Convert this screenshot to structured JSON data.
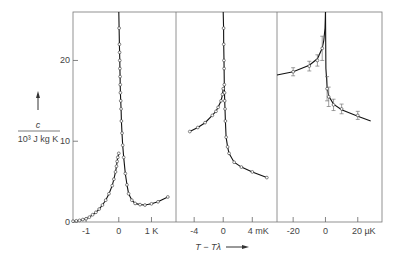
{
  "chart_data": {
    "type": "line",
    "title": "",
    "ylabel_numerator": "c",
    "ylabel_denominator": "10³ J kg K",
    "xlabel": "T − Tλ",
    "ylim": [
      0,
      26
    ],
    "yticks": [
      0,
      10,
      20
    ],
    "ytick_labels": [
      "0",
      "10",
      "20"
    ],
    "grid": false,
    "legend": null,
    "panels": [
      {
        "name": "K-scale",
        "xlim": [
          -1.4,
          1.75
        ],
        "xticks": [
          -1,
          0,
          1
        ],
        "xtick_labels": [
          "-1",
          "0",
          "1 K"
        ],
        "unit": "K",
        "markers": "circles",
        "series": [
          {
            "name": "below-lambda",
            "x": [
              -1.4,
              -1.3,
              -1.2,
              -1.1,
              -1.0,
              -0.9,
              -0.8,
              -0.7,
              -0.6,
              -0.5,
              -0.4,
              -0.3,
              -0.2,
              -0.15,
              -0.1,
              -0.07,
              -0.05,
              -0.03,
              0
            ],
            "y": [
              0.1,
              0.15,
              0.2,
              0.3,
              0.4,
              0.6,
              0.9,
              1.2,
              1.6,
              2.1,
              2.7,
              3.5,
              4.5,
              5.3,
              6.2,
              6.9,
              7.5,
              8.0,
              8.5
            ]
          },
          {
            "name": "above-lambda",
            "x": [
              0.0,
              0.01,
              0.02,
              0.025,
              0.03,
              0.035,
              0.04,
              0.045,
              0.05,
              0.06,
              0.07,
              0.08,
              0.1,
              0.12,
              0.15,
              0.2,
              0.25,
              0.3,
              0.4,
              0.5,
              0.65,
              0.8,
              1.0,
              1.2,
              1.5
            ],
            "y": [
              26,
              24,
              22,
              21,
              20,
              19,
              18,
              17,
              16,
              15,
              14,
              12.5,
              11,
              9.5,
              8,
              6,
              4.6,
              3.5,
              2.7,
              2.3,
              2.15,
              2.1,
              2.25,
              2.5,
              3.1
            ]
          }
        ]
      },
      {
        "name": "mK-scale",
        "xlim": [
          -6.5,
          7.4
        ],
        "xticks": [
          -4,
          0,
          4
        ],
        "xtick_labels": [
          "-4",
          "0",
          "4 mK"
        ],
        "unit": "mK",
        "markers": "circles",
        "series": [
          {
            "name": "below-lambda",
            "x": [
              -4.6,
              -3.5,
              -2.5,
              -1.5,
              -1.0,
              -0.7,
              -0.3,
              -0.1,
              0
            ],
            "y": [
              11.2,
              11.7,
              12.3,
              13.2,
              13.7,
              14.2,
              15.0,
              15.8,
              16.5
            ]
          },
          {
            "name": "above-lambda",
            "x": [
              0.0,
              0.05,
              0.07,
              0.1,
              0.12,
              0.15,
              0.18,
              0.2,
              0.25,
              0.3,
              0.4,
              0.6,
              0.8,
              1.5,
              2.5,
              4.0,
              6.0
            ],
            "y": [
              26,
              24,
              22,
              20,
              19,
              17,
              16,
              15,
              14,
              12.5,
              10.5,
              9.3,
              8.5,
              7.4,
              6.8,
              6.2,
              5.5
            ]
          }
        ]
      },
      {
        "name": "uK-scale",
        "xlim": [
          -30,
          35
        ],
        "xticks": [
          -20,
          0,
          20
        ],
        "xtick_labels": [
          "-20",
          "0",
          "20 µK"
        ],
        "unit": "µK",
        "markers": "circles-with-error-bars",
        "series": [
          {
            "name": "below-lambda",
            "x": [
              -20,
              -10,
              -5,
              -2
            ],
            "y": [
              18.6,
              19.3,
              20.0,
              21.5
            ],
            "yerr": [
              0.5,
              0.6,
              0.7,
              1.5
            ]
          },
          {
            "name": "above-lambda",
            "x": [
              1,
              2,
              5,
              10,
              20
            ],
            "y": [
              16.5,
              15.5,
              14.5,
              14.0,
              13.2
            ],
            "yerr": [
              1.5,
              1.2,
              0.7,
              0.6,
              0.5
            ]
          },
          {
            "name": "fit-below",
            "x": [
              -30,
              -20,
              -10,
              -5,
              -2,
              -1,
              -0.3,
              0
            ],
            "y": [
              18.2,
              18.6,
              19.4,
              20.2,
              21.5,
              22.5,
              24,
              26
            ]
          },
          {
            "name": "fit-above",
            "x": [
              0,
              0.3,
              1,
              2,
              5,
              10,
              20,
              28
            ],
            "y": [
              26,
              19,
              16.7,
              15.6,
              14.6,
              13.9,
              13.1,
              12.5
            ]
          }
        ]
      }
    ]
  },
  "labels": {
    "y_numerator": "c",
    "y_denominator": "10³ J kg K",
    "x_axis": "T − Tλ"
  }
}
